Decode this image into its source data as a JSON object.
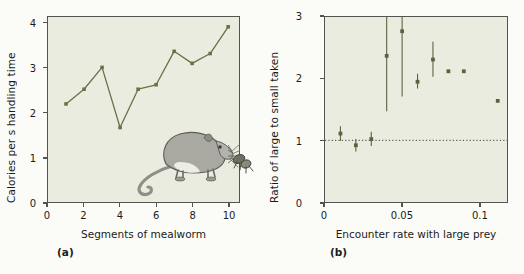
{
  "figure": {
    "background_color": "#fbfbf7",
    "plot_background_color": "#e9ecdf",
    "axis_color": "#55534f",
    "series_color": "#6b7048",
    "marker_color": "#5c6140"
  },
  "panels": [
    {
      "tag": "(a)",
      "xlabel": "Segments of mealworm",
      "ylabel": "Calories per s handling time",
      "xticks": [
        "0",
        "2",
        "4",
        "6",
        "8",
        "10"
      ],
      "yticks": [
        "0",
        "1",
        "2",
        "3",
        "4"
      ],
      "illustration": "shrew-and-mealworm-illustration"
    },
    {
      "tag": "(b)",
      "xlabel": "Encounter rate with large prey",
      "ylabel": "Ratio of large to small taken",
      "xticks": [
        "0",
        "0.05",
        "0.1"
      ],
      "yticks": [
        "0",
        "1",
        "2",
        "3"
      ],
      "reference_line_value": "1"
    }
  ],
  "chart_data": [
    {
      "type": "line",
      "title": "",
      "panel": "(a)",
      "xlabel": "Segments of mealworm",
      "ylabel": "Calories per s handling time",
      "xlim": [
        0,
        10.6
      ],
      "ylim": [
        0,
        4.15
      ],
      "xticks": [
        0,
        2,
        4,
        6,
        8,
        10
      ],
      "yticks": [
        0,
        1,
        2,
        3,
        4
      ],
      "grid": false,
      "legend": "none",
      "x": [
        1,
        2,
        3,
        4,
        5,
        6,
        7,
        8,
        9,
        10
      ],
      "values": [
        2.2,
        2.53,
        3.02,
        1.67,
        2.53,
        2.63,
        3.38,
        3.11,
        3.33,
        3.93
      ],
      "marker": "square",
      "line_color": "#6b7048"
    },
    {
      "type": "scatter",
      "title": "",
      "panel": "(b)",
      "xlabel": "Encounter rate with large prey",
      "ylabel": "Ratio of large to small taken",
      "xlim": [
        0,
        0.118
      ],
      "ylim": [
        0,
        3
      ],
      "xticks": [
        0,
        0.05,
        0.1
      ],
      "yticks": [
        0,
        1,
        2,
        3
      ],
      "grid": false,
      "legend": "none",
      "reference_line_y": 1,
      "reference_line_style": "dotted",
      "points": [
        {
          "x": 0.01,
          "y": 1.11,
          "err_low": 0.99,
          "err_high": 1.23
        },
        {
          "x": 0.02,
          "y": 0.92,
          "err_low": 0.82,
          "err_high": 1.02
        },
        {
          "x": 0.03,
          "y": 1.02,
          "err_low": 0.91,
          "err_high": 1.14
        },
        {
          "x": 0.04,
          "y": 2.37,
          "err_low": 1.47,
          "err_high": 3.0
        },
        {
          "x": 0.05,
          "y": 2.77,
          "err_low": 1.71,
          "err_high": 3.0
        },
        {
          "x": 0.06,
          "y": 1.95,
          "err_low": 1.84,
          "err_high": 2.08
        },
        {
          "x": 0.07,
          "y": 2.31,
          "err_low": 2.03,
          "err_high": 2.6
        },
        {
          "x": 0.08,
          "y": 2.12,
          "err_low": 2.12,
          "err_high": 2.12
        },
        {
          "x": 0.09,
          "y": 2.12,
          "err_low": 2.12,
          "err_high": 2.12
        },
        {
          "x": 0.112,
          "y": 1.64,
          "err_low": 1.64,
          "err_high": 1.64
        }
      ],
      "marker": "square",
      "marker_color": "#5c6140"
    }
  ]
}
